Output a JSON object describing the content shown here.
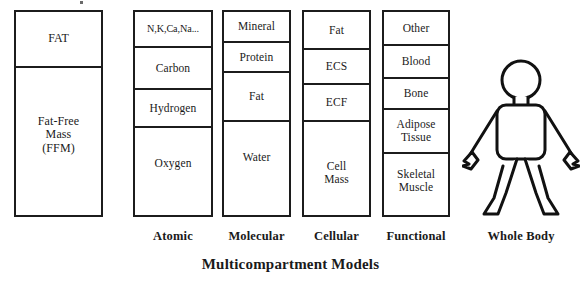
{
  "figure": {
    "title": "Multicompartment Models",
    "background_color": "#ffffff",
    "line_color": "#1c1c1c"
  },
  "columns": [
    {
      "id": "two-compartment",
      "caption": "",
      "cells": [
        {
          "label": "FAT"
        },
        {
          "label": "Fat-Free\nMass\n(FFM)"
        }
      ]
    },
    {
      "id": "atomic",
      "caption": "Atomic",
      "cells": [
        {
          "label": "N,K,Ca,Na..."
        },
        {
          "label": "Carbon"
        },
        {
          "label": "Hydrogen"
        },
        {
          "label": "Oxygen"
        }
      ]
    },
    {
      "id": "molecular",
      "caption": "Molecular",
      "cells": [
        {
          "label": "Mineral"
        },
        {
          "label": "Protein"
        },
        {
          "label": "Fat"
        },
        {
          "label": "Water"
        }
      ]
    },
    {
      "id": "cellular",
      "caption": "Cellular",
      "cells": [
        {
          "label": "Fat"
        },
        {
          "label": "ECS"
        },
        {
          "label": "ECF"
        },
        {
          "label": "Cell\nMass"
        }
      ]
    },
    {
      "id": "functional",
      "caption": "Functional",
      "cells": [
        {
          "label": "Other"
        },
        {
          "label": "Blood"
        },
        {
          "label": "Bone"
        },
        {
          "label": "Adipose\nTissue"
        },
        {
          "label": "Skeletal\nMuscle"
        }
      ]
    },
    {
      "id": "whole-body",
      "caption": "Whole Body",
      "cells": []
    }
  ]
}
